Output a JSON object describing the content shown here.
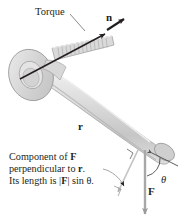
{
  "figure": {
    "background_color": "#ffffff",
    "ink_color": "#231f20",
    "wrench_fill": "#d9d9d9",
    "wrench_shade": "#bfbfbf",
    "wrench_outline": "#8a8a8a",
    "vector_gray": "#a8a8a8"
  },
  "labels": {
    "torque": "Torque",
    "normal_vector": "n",
    "radius_vector": "r",
    "force_vector": "F",
    "angle": "θ"
  },
  "caption": {
    "line1_pre": "Component of ",
    "line1_bold": "F",
    "line2_pre": "perpendicular to ",
    "line2_bold": "r",
    "line2_post": ".",
    "line3_pre": "Its length is |",
    "line3_bold": "F",
    "line3_mid": "| sin ",
    "line3_theta": "θ",
    "line3_post": "."
  },
  "annotations": {
    "right_angle_marker": "right-angle",
    "angle_arc": "theta-arc",
    "leader_line": "caption-leader"
  }
}
